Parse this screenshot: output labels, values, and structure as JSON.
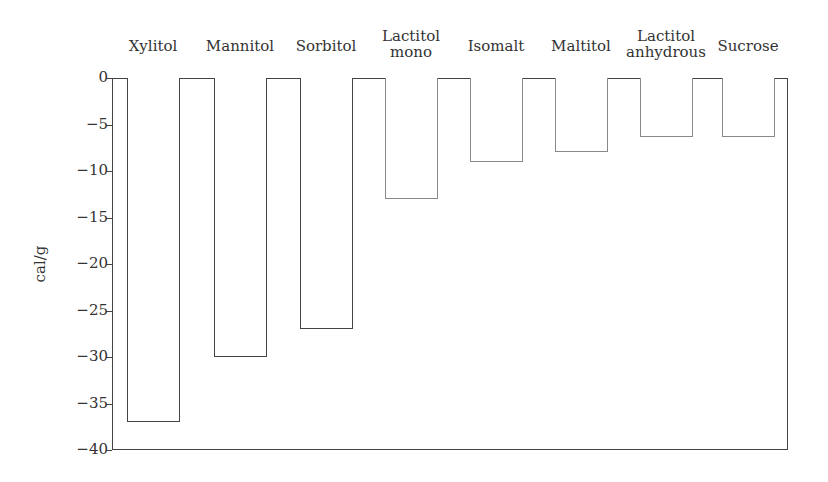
{
  "chart_data": {
    "type": "bar",
    "title": "",
    "xlabel": "",
    "ylabel": "cal/g",
    "ylim": [
      -40,
      0
    ],
    "yticks": [
      0,
      -5,
      -10,
      -15,
      -20,
      -25,
      -30,
      -35,
      -40
    ],
    "ytick_labels": [
      "0",
      "−5",
      "−10",
      "−15",
      "−20",
      "−25",
      "−30",
      "−35",
      "−40"
    ],
    "categories": [
      "Xylitol",
      "Mannitol",
      "Sorbitol",
      "Lactitol\nmono",
      "Isomalt",
      "Maltitol",
      "Lactitol\nanhydrous",
      "Sucrose"
    ],
    "values": [
      -37,
      -30,
      -27,
      -13,
      -9,
      -8,
      -6.3,
      -6.3
    ],
    "category_axis_position": "top",
    "grid": false,
    "legend": null
  },
  "style": {
    "bar_edge_dark": "#444444",
    "bar_edge_light": "#888888",
    "bar_fill": "#ffffff"
  }
}
